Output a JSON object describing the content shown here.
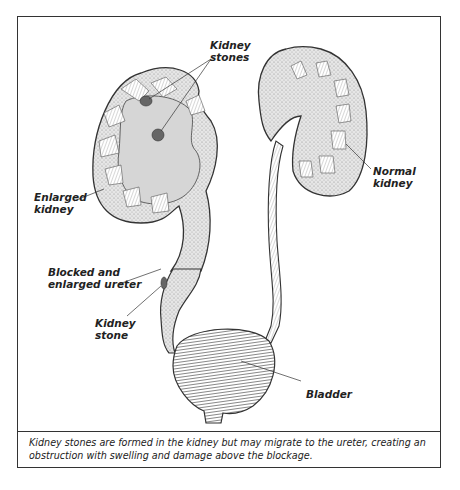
{
  "figure": {
    "labels": {
      "kidney_stones": [
        "Kidney",
        "stones"
      ],
      "enlarged_kidney": [
        "Enlarged",
        "kidney"
      ],
      "normal_kidney": [
        "Normal",
        "kidney"
      ],
      "blocked_ureter": [
        "Blocked and",
        "enlarged ureter"
      ],
      "kidney_stone": [
        "Kidney",
        "stone"
      ],
      "bladder": "Bladder"
    },
    "caption": "Kidney stones are formed in the kidney but may migrate to the ureter, creating an obstruction with swelling and damage above the blockage."
  },
  "colors": {
    "line": "#333333",
    "fill": "#d9d9d9",
    "stone": "#666666"
  }
}
